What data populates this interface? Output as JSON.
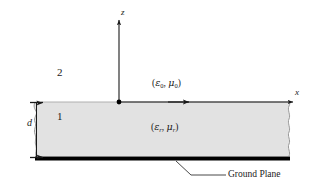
{
  "figure": {
    "background_color": "#ffffff",
    "slab_fill_color": "#e2e2e2",
    "slab_edge_color": "#8c8c8c",
    "line_color": "#1a1a1a",
    "ground_plane_color": "#000000"
  },
  "axes": {
    "z_label": "z",
    "x_label": "x",
    "origin_marker": "origin-dot"
  },
  "regions": [
    {
      "id": "region-2",
      "number": "2",
      "description": "free space above slab"
    },
    {
      "id": "region-1",
      "number": "1",
      "description": "dielectric slab"
    }
  ],
  "materials": {
    "upper": {
      "open": "(",
      "epsilon": "ε",
      "epsilon_sub": "0",
      "comma": ", ",
      "mu": "μ",
      "mu_sub": "0",
      "close": ")"
    },
    "lower": {
      "open": "(",
      "epsilon": "ε",
      "epsilon_sub": "r",
      "comma": ", ",
      "mu": "μ",
      "mu_sub": "r",
      "close": ")"
    }
  },
  "dimension": {
    "thickness_label": "d"
  },
  "callouts": {
    "ground_plane": "Ground Plane"
  }
}
